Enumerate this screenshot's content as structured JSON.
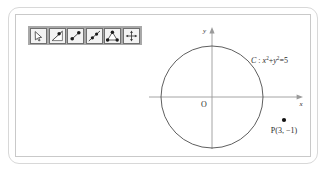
{
  "app": {
    "title": "Geometry sketch"
  },
  "toolbar": {
    "name": "geometry-toolbar",
    "background_color": "#a8a8a8",
    "items": [
      {
        "id": "select",
        "icon": "cursor-arrow-icon",
        "label": "Select / Move pointer"
      },
      {
        "id": "point-on-object",
        "icon": "point-on-object-icon",
        "label": "Point on object"
      },
      {
        "id": "segment-points",
        "icon": "segment-with-points-icon",
        "label": "Segment between two points"
      },
      {
        "id": "line",
        "icon": "line-icon",
        "label": "Line"
      },
      {
        "id": "polygon",
        "icon": "polygon-triangle-icon",
        "label": "Polygon"
      },
      {
        "id": "move-view",
        "icon": "move-four-arrows-icon",
        "label": "Move graphics view"
      }
    ]
  },
  "graph": {
    "axes": {
      "x_label": "x",
      "y_label": "y",
      "origin_label": "O",
      "x_axis_color": "#9a9a9a",
      "y_axis_color": "#9a9a9a"
    },
    "circle": {
      "name": "C",
      "center": [
        0,
        0
      ],
      "radius_squared": 5,
      "label_prefix": "C",
      "label_separator": " : ",
      "label_x": "x",
      "label_x_sup": "2",
      "label_plus": "+",
      "label_y": "y",
      "label_y_sup": "2",
      "label_equals": "=",
      "label_value": "5",
      "stroke_color": "#4d4d4d"
    },
    "point": {
      "name": "P",
      "label": "P(3, −1)",
      "x": 3,
      "y": -1,
      "color": "#111111"
    }
  }
}
